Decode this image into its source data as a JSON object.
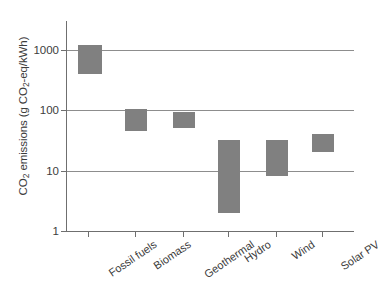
{
  "chart_data": {
    "type": "bar",
    "subtype": "range-bar",
    "title": "",
    "xlabel": "",
    "ylabel": "CO2 emissions (g CO2-eq/kWh)",
    "ylabel_parts": {
      "prefix": "CO",
      "sub1": "2",
      "middle": " emissions (g CO",
      "sub2": "2",
      "suffix": "-eq/kWh)"
    },
    "yscale": "log",
    "ylim": [
      1,
      3000
    ],
    "yticks": [
      1000,
      100,
      10,
      1
    ],
    "ytick_labels": [
      "1000",
      "100",
      "10",
      "1"
    ],
    "gridlines": [
      1000,
      100,
      10
    ],
    "grid": true,
    "legend": null,
    "categories": [
      "Fossil fuels",
      "Biomass",
      "Geothermal",
      "Hydro",
      "Wind",
      "Solar PV"
    ],
    "bar_color": "#808080",
    "ranges": [
      {
        "category": "Fossil fuels",
        "low": 400,
        "high": 1200
      },
      {
        "category": "Biomass",
        "low": 45,
        "high": 105
      },
      {
        "category": "Geothermal",
        "low": 50,
        "high": 95
      },
      {
        "category": "Hydro",
        "low": 2,
        "high": 32
      },
      {
        "category": "Wind",
        "low": 8,
        "high": 32
      },
      {
        "category": "Solar PV",
        "low": 20,
        "high": 40
      }
    ]
  },
  "axis": {
    "y_tick_labels": [
      "1000",
      "100",
      "10",
      "1"
    ],
    "x_tick_labels": [
      "Fossil fuels",
      "Biomass",
      "Geothermal",
      "Hydro",
      "Wind",
      "Solar PV"
    ]
  }
}
